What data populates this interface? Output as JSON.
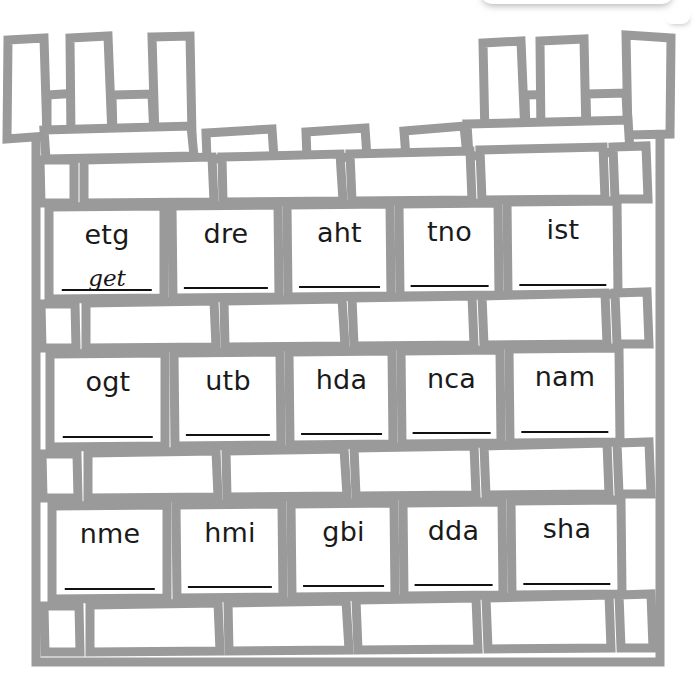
{
  "worksheet": {
    "title": "Castle Wall Word Scramble",
    "theme": "castle-wall",
    "mortar_color": "#9a9a9a",
    "brick_fill": "#ffffff",
    "text_color": "#1a1a1a",
    "answer_line_color": "#111111"
  },
  "rows": [
    {
      "row_index": 1,
      "cards": [
        {
          "scrambled": "etg",
          "answer": "get"
        },
        {
          "scrambled": "dre",
          "answer": ""
        },
        {
          "scrambled": "aht",
          "answer": ""
        },
        {
          "scrambled": "tno",
          "answer": ""
        },
        {
          "scrambled": "ist",
          "answer": ""
        }
      ]
    },
    {
      "row_index": 2,
      "cards": [
        {
          "scrambled": "ogt",
          "answer": ""
        },
        {
          "scrambled": "utb",
          "answer": ""
        },
        {
          "scrambled": "hda",
          "answer": ""
        },
        {
          "scrambled": "nca",
          "answer": ""
        },
        {
          "scrambled": "nam",
          "answer": ""
        }
      ]
    },
    {
      "row_index": 3,
      "cards": [
        {
          "scrambled": "nme",
          "answer": ""
        },
        {
          "scrambled": "hmi",
          "answer": ""
        },
        {
          "scrambled": "gbi",
          "answer": ""
        },
        {
          "scrambled": "dda",
          "answer": ""
        },
        {
          "scrambled": "sha",
          "answer": ""
        }
      ]
    }
  ]
}
